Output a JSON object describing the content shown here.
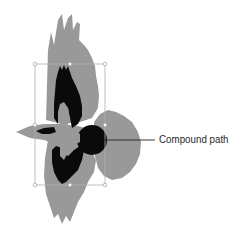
{
  "figure": {
    "callout": {
      "label": "Compound path"
    },
    "colors": {
      "silhouette": "#999999",
      "compound_path": "#0a0a0a",
      "selection_box": "#b0b0b0",
      "leader_line": "#222222",
      "background": "#ffffff"
    },
    "selection_box": {
      "x": 35,
      "y": 64,
      "width": 70,
      "height": 121,
      "handles": 8
    }
  }
}
